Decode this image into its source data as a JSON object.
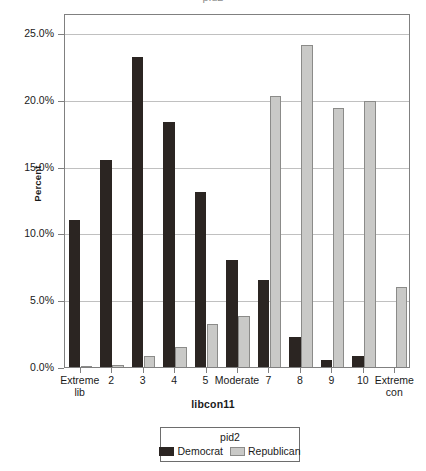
{
  "cut_title": "pid2",
  "chart_data": {
    "type": "bar",
    "title": "",
    "xlabel": "libcon11",
    "ylabel": "Percent",
    "ylim": [
      0,
      26.5
    ],
    "ytick_values": [
      0,
      5,
      10,
      15,
      20,
      25
    ],
    "ytick_labels": [
      "0.0%",
      "5.0%",
      "10.0%",
      "15.0%",
      "20.0%",
      "25.0%"
    ],
    "grid": true,
    "legend_position": "bottom",
    "legend_title": "pid2",
    "categories": [
      "Extreme\nlib",
      "2",
      "3",
      "4",
      "5",
      "Moderate",
      "7",
      "8",
      "9",
      "10",
      "Extreme\ncon"
    ],
    "category_labels": [
      "Extreme lib",
      "2",
      "3",
      "4",
      "5",
      "Moderate",
      "7",
      "8",
      "9",
      "10",
      "Extreme con"
    ],
    "series": [
      {
        "name": "Democrat",
        "color": "#2b2522",
        "values": [
          11.1,
          15.6,
          23.3,
          18.4,
          13.2,
          8.1,
          6.6,
          2.3,
          0.6,
          0.9,
          0.0
        ]
      },
      {
        "name": "Republican",
        "color": "#c9c9c7",
        "values": [
          0.15,
          0.2,
          0.9,
          1.6,
          3.3,
          3.9,
          20.4,
          24.2,
          19.5,
          20.0,
          6.1
        ]
      }
    ]
  }
}
